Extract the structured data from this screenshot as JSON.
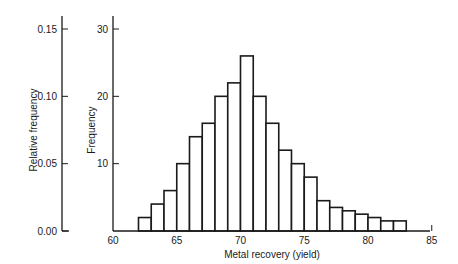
{
  "chart_data": {
    "type": "bar",
    "title": "",
    "xlabel": "Metal recovery (yield)",
    "ylabel": "Frequency",
    "ylabel_secondary": "Relative frequency",
    "bin_width": 1,
    "bin_start": 62,
    "categories": [
      "62-63",
      "63-64",
      "64-65",
      "65-66",
      "66-67",
      "67-68",
      "68-69",
      "69-70",
      "70-71",
      "71-72",
      "72-73",
      "73-74",
      "74-75",
      "75-76",
      "76-77",
      "77-78",
      "78-79",
      "79-80",
      "80-81",
      "81-82",
      "82-83"
    ],
    "values": [
      2,
      4,
      6,
      10,
      14,
      16,
      20,
      22,
      26,
      20,
      16,
      12,
      10,
      8,
      4.5,
      3.5,
      3,
      2.5,
      2,
      1.5,
      1.5
    ],
    "xlim": [
      60,
      85
    ],
    "ylim": [
      0,
      30
    ],
    "ylim_secondary": [
      0.0,
      0.15
    ],
    "x_ticks": [
      "60",
      "65",
      "70",
      "75",
      "80",
      "85"
    ],
    "y_ticks": [
      "10",
      "20",
      "30"
    ],
    "y_ticks_secondary": [
      "0.00",
      "0.05",
      "0.10",
      "0.15"
    ],
    "grid": false,
    "legend": null
  }
}
